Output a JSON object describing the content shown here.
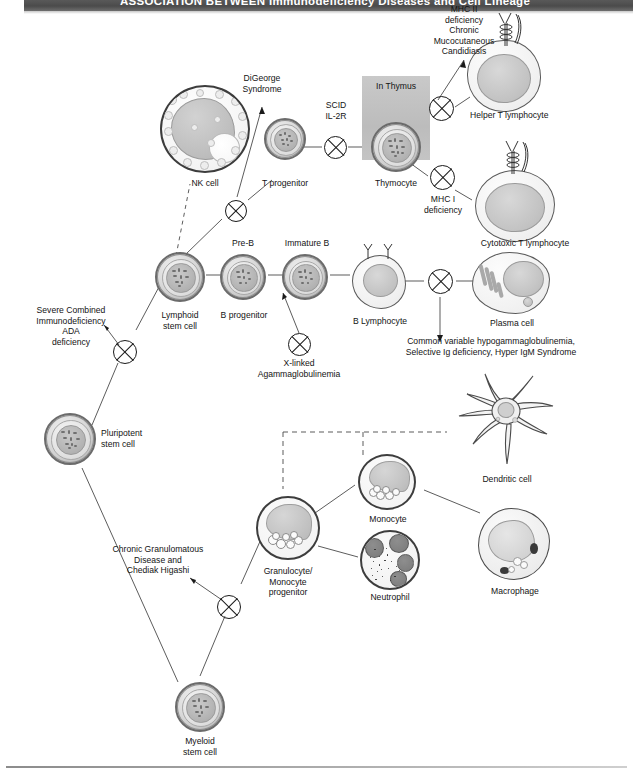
{
  "header": {
    "title": "ASSOCIATION BETWEEN Immunodeficiency Diseases and Cell Lineage"
  },
  "diagram": {
    "type": "hematopoietic-lineage-flowchart",
    "cells": [
      {
        "id": "pluripotent-stem-cell",
        "label": "Pluripotent\nstem cell"
      },
      {
        "id": "lymphoid-stem-cell",
        "label": "Lymphoid\nstem cell"
      },
      {
        "id": "myeloid-stem-cell",
        "label": "Myeloid\nstem cell"
      },
      {
        "id": "nk-cell",
        "label": "NK cell"
      },
      {
        "id": "t-progenitor",
        "label": "T progenitor"
      },
      {
        "id": "thymocyte",
        "label": "Thymocyte"
      },
      {
        "id": "helper-t-lymphocyte",
        "label": "Helper T lymphocyte"
      },
      {
        "id": "cytotoxic-t-lymphocyte",
        "label": "Cytotoxic T lymphocyte"
      },
      {
        "id": "b-progenitor",
        "label": "B progenitor"
      },
      {
        "id": "b-lymphocyte",
        "label": "B Lymphocyte"
      },
      {
        "id": "plasma-cell",
        "label": "Plasma cell"
      },
      {
        "id": "granulocyte-monocyte-progenitor",
        "label": "Granulocyte/\nMonocyte\nprogenitor"
      },
      {
        "id": "monocyte",
        "label": "Monocyte"
      },
      {
        "id": "neutrophil",
        "label": "Neutrophil"
      },
      {
        "id": "macrophage",
        "label": "Macrophage"
      },
      {
        "id": "dendritic-cell",
        "label": "Dendritic cell"
      }
    ],
    "stage_labels": [
      {
        "id": "pre-b",
        "label": "Pre-B"
      },
      {
        "id": "immature-b",
        "label": "Immature B"
      },
      {
        "id": "in-thymus",
        "label": "In Thymus"
      }
    ],
    "disease_annotations": [
      {
        "id": "digeorge-syndrome",
        "label": "DiGeorge\nSyndrome"
      },
      {
        "id": "scid-il2r",
        "label": "SCID\nIL-2R"
      },
      {
        "id": "mhc-2-deficiency",
        "label": "MHC II\ndeficiency\nChronic\nMucocutaneous\nCandidiasis"
      },
      {
        "id": "mhc-1-deficiency",
        "label": "MHC I\ndeficiency"
      },
      {
        "id": "severe-combined-immunodeficiency-ada",
        "label": "Severe Combined\nImmunodeficiency\nADA\ndeficiency"
      },
      {
        "id": "x-linked-agammaglobulinemia",
        "label": "X-linked\nAgammaglobulinemia"
      },
      {
        "id": "common-variable-hypogammaglobulinemia",
        "label": "Common variable hypogammaglobulinemia,\nSelective Ig deficiency, Hyper IgM Syndrome"
      },
      {
        "id": "chronic-granulomatous-disease-chediak-higashi",
        "label": "Chronic Granulomatous\nDisease and\nChediak Higashi"
      }
    ],
    "block_symbols": [
      {
        "id": "block-digeorge",
        "meaning": "developmental block - DiGeorge Syndrome"
      },
      {
        "id": "block-scid-il2r",
        "meaning": "developmental block - SCID IL-2R"
      },
      {
        "id": "block-mhc-2",
        "meaning": "developmental block - MHC II deficiency"
      },
      {
        "id": "block-mhc-1",
        "meaning": "developmental block - MHC I deficiency"
      },
      {
        "id": "block-scid-ada",
        "meaning": "developmental block - SCID / ADA deficiency"
      },
      {
        "id": "block-xla",
        "meaning": "developmental block - X-linked Agammaglobulinemia"
      },
      {
        "id": "block-plasma",
        "meaning": "developmental block - antibody deficiencies"
      },
      {
        "id": "block-cgd",
        "meaning": "developmental block - CGD / Chediak Higashi"
      }
    ],
    "colors": {
      "header_band": "#4b4b4b",
      "header_text": "#ffffff",
      "line": "#3f3f3f",
      "text": "#141414",
      "thymus_shade": "#c2c2c2"
    }
  }
}
